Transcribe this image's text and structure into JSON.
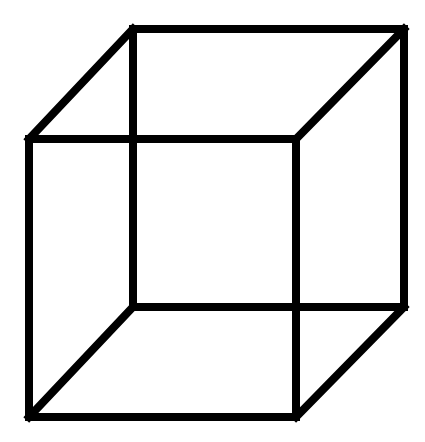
{
  "diagram": {
    "stroke_color": "#000000",
    "background": "#ffffff",
    "stroke_width": 8,
    "vertices": {
      "back_top_left": [
        133,
        29
      ],
      "back_top_right": [
        404,
        29
      ],
      "back_bottom_left": [
        133,
        307
      ],
      "back_bottom_right": [
        404,
        307
      ],
      "front_top_left": [
        29,
        139
      ],
      "front_top_right": [
        296,
        139
      ],
      "front_bottom_left": [
        29,
        417
      ],
      "front_bottom_right": [
        296,
        417
      ]
    },
    "edges": [
      {
        "name": "back-top-edge",
        "from": "back_top_left",
        "to": "back_top_right"
      },
      {
        "name": "back-bottom-edge",
        "from": "back_bottom_left",
        "to": "back_bottom_right"
      },
      {
        "name": "back-left-edge",
        "from": "back_top_left",
        "to": "back_bottom_left"
      },
      {
        "name": "back-right-edge",
        "from": "back_top_right",
        "to": "back_bottom_right"
      },
      {
        "name": "front-top-edge",
        "from": "front_top_left",
        "to": "front_top_right"
      },
      {
        "name": "front-bottom-edge",
        "from": "front_bottom_left",
        "to": "front_bottom_right"
      },
      {
        "name": "front-left-edge",
        "from": "front_top_left",
        "to": "front_bottom_left"
      },
      {
        "name": "front-right-edge",
        "from": "front_top_right",
        "to": "front_bottom_right"
      },
      {
        "name": "top-left-connector",
        "from": "front_top_left",
        "to": "back_top_left"
      },
      {
        "name": "top-right-connector",
        "from": "front_top_right",
        "to": "back_top_right"
      },
      {
        "name": "bottom-left-connector",
        "from": "front_bottom_left",
        "to": "back_bottom_left"
      },
      {
        "name": "bottom-right-connector",
        "from": "front_bottom_right",
        "to": "back_bottom_right"
      }
    ]
  }
}
